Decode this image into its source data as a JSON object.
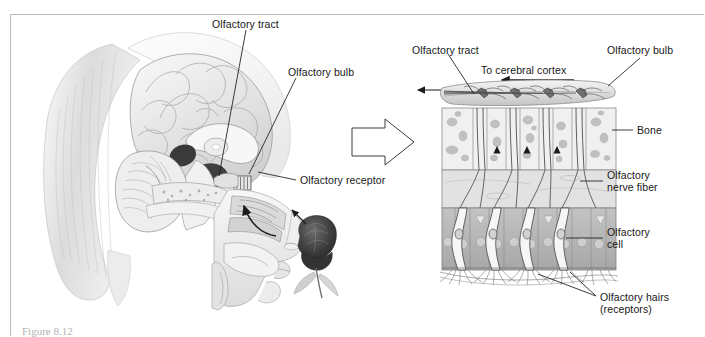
{
  "figure": {
    "caption": "Figure 8.12",
    "frame_color": "#b9b9b9",
    "background": "#ffffff",
    "text_color": "#171717"
  },
  "left_panel": {
    "name": "sagittal-head-section",
    "labels": [
      {
        "id": "olfactory-tract",
        "text": "Olfactory tract",
        "x": 212,
        "y": 18
      },
      {
        "id": "olfactory-bulb",
        "text": "Olfactory bulb",
        "x": 288,
        "y": 66
      },
      {
        "id": "olfactory-receptor",
        "text": "Olfactory receptor",
        "x": 300,
        "y": 180
      }
    ],
    "elements": {
      "hair": "hair-strands",
      "brain": "brain-sagittal",
      "cerebellum": "cerebellum",
      "corpus_callosum": "corpus-callosum",
      "nasal_cavity": "nasal-cavity",
      "turbinates": "nasal-turbinates",
      "tongue": "tongue",
      "rose": "rose-flower",
      "odor_arrow": "odor-airflow-arrow",
      "rose_arrow": "rose-to-nose-arrow"
    }
  },
  "transition": {
    "name": "magnification-arrow",
    "direction": "right"
  },
  "right_panel": {
    "name": "olfactory-epithelium-detail",
    "labels": [
      {
        "id": "olfactory-tract",
        "text": "Olfactory tract",
        "x": 412,
        "y": 44
      },
      {
        "id": "to-cerebral-cortex",
        "text": "To cerebral cortex",
        "x": 481,
        "y": 70
      },
      {
        "id": "olfactory-bulb",
        "text": "Olfactory bulb",
        "x": 607,
        "y": 48
      },
      {
        "id": "bone",
        "text": "Bone",
        "x": 637,
        "y": 127
      },
      {
        "id": "olfactory-nerve-fiber-1",
        "text": "Olfactory",
        "x": 607,
        "y": 176
      },
      {
        "id": "olfactory-nerve-fiber-2",
        "text": "nerve fiber",
        "x": 607,
        "y": 187
      },
      {
        "id": "olfactory-cell-1",
        "text": "Olfactory",
        "x": 607,
        "y": 233
      },
      {
        "id": "olfactory-cell-2",
        "text": "cell",
        "x": 607,
        "y": 244
      },
      {
        "id": "olfactory-hairs-1",
        "text": "Olfactory hairs",
        "x": 600,
        "y": 299
      },
      {
        "id": "olfactory-hairs-2",
        "text": "(receptors)",
        "x": 600,
        "y": 311
      }
    ],
    "layers": {
      "bulb": "olfactory-bulb-layer",
      "bone": "cribriform-bone-layer",
      "epithelium": "olfactory-epithelium-layer",
      "cilia": "olfactory-cilia-layer"
    },
    "cell_count": 4,
    "bone_block_count": 5
  },
  "colors": {
    "ink": "#2a2a2a",
    "bone_fill": "#efefef",
    "bone_pore": "#b9b9b9",
    "bulb_fill": "#e4e4e4",
    "epithelium_fill": "#b4b4b4",
    "epithelium_light": "#dedede",
    "cell_fill": "#f4f4f4",
    "nucleus": "#c9c9c9",
    "rose_dark": "#3d3d3d",
    "brain_fill": "#e8e8e8",
    "hair_fill": "#dcdcdc"
  }
}
